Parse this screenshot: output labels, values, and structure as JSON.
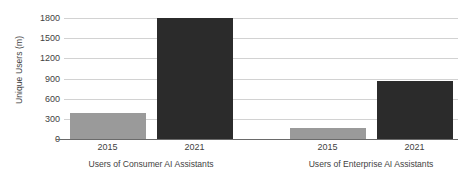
{
  "chart_data": {
    "type": "bar",
    "title": "",
    "xlabel": "",
    "ylabel": "Unique Users (m)",
    "ylim": [
      0,
      1800
    ],
    "yticks": [
      0,
      300,
      600,
      900,
      1200,
      1500,
      1800
    ],
    "ytick_labels": [
      "0",
      "300",
      "600",
      "900",
      "1200",
      "1500",
      "1800"
    ],
    "grid": true,
    "legend": "none",
    "categories": [
      "2015",
      "2021"
    ],
    "groups": [
      {
        "label": "Users of Consumer AI Assistants",
        "bars": [
          {
            "category": "2015",
            "value": 385,
            "color": "#9a9a9a"
          },
          {
            "category": "2021",
            "value": 1800,
            "color": "#2b2b2b"
          }
        ]
      },
      {
        "label": "Users of Enterprise AI Assistants",
        "bars": [
          {
            "category": "2015",
            "value": 170,
            "color": "#9a9a9a"
          },
          {
            "category": "2021",
            "value": 865,
            "color": "#2b2b2b"
          }
        ]
      }
    ],
    "colors": {
      "series_2015": "#9a9a9a",
      "series_2021": "#2b2b2b",
      "gridline": "#d2d2d2",
      "axis": "#6a6a6a",
      "text": "#3f3f3f",
      "background": "#ffffff"
    }
  }
}
